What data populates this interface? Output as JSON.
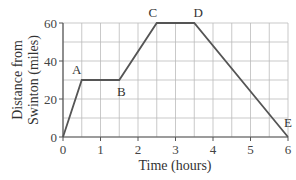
{
  "chart_data": {
    "type": "line",
    "title": "",
    "xlabel": "Time (hours)",
    "ylabel_lines": [
      "Distance from",
      "Swinton (miles)"
    ],
    "ylabel": "Distance from Swinton (miles)",
    "xlim": [
      0,
      6
    ],
    "ylim": [
      0,
      60
    ],
    "x_ticks": [
      0,
      1,
      2,
      3,
      4,
      5,
      6
    ],
    "y_ticks": [
      0,
      20,
      40,
      60
    ],
    "grid": true,
    "grid_x_step": 0.5,
    "grid_y_step": 10,
    "legend": null,
    "series": [
      {
        "name": "journey",
        "x": [
          0,
          0.5,
          1.5,
          2.5,
          3.5,
          6
        ],
        "y": [
          0,
          30,
          30,
          60,
          60,
          0
        ]
      }
    ],
    "annotations": [
      {
        "label": "A",
        "x": 0.5,
        "y": 30
      },
      {
        "label": "B",
        "x": 1.5,
        "y": 30
      },
      {
        "label": "C",
        "x": 2.5,
        "y": 60
      },
      {
        "label": "D",
        "x": 3.5,
        "y": 60
      },
      {
        "label": "E",
        "x": 6,
        "y": 0
      }
    ]
  },
  "colors": {
    "line": "#555555",
    "grid": "#bbbbbb",
    "axis": "#555555",
    "text": "#333333"
  }
}
